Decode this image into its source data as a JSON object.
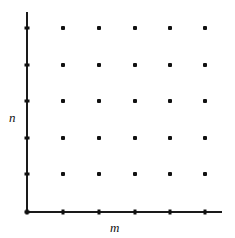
{
  "figure": {
    "name": "integer-lattice-grid",
    "background_color": "#ffffff",
    "width": 235,
    "height": 238
  },
  "axes": {
    "x_axis": {
      "label": "m",
      "color": "#1a1a1a",
      "line_width": 2,
      "y_pixel": 212,
      "start_x_pixel": 27,
      "end_x_pixel": 222
    },
    "y_axis": {
      "label": "n",
      "color": "#1a1a1a",
      "line_width": 2,
      "x_pixel": 27,
      "start_y_pixel": 12,
      "end_y_pixel": 212
    },
    "tick_color": "#111111",
    "tick_size": 5
  },
  "chart_data": {
    "type": "scatter",
    "title": "",
    "xlabel": "m",
    "ylabel": "n",
    "grid": false,
    "legend": null,
    "point_color": "#111111",
    "point_size_px": 4,
    "point_shape": "square",
    "xlim": [
      0,
      6
    ],
    "ylim": [
      0,
      6
    ],
    "x_ticks": [
      0,
      1,
      2,
      3,
      4,
      5
    ],
    "y_ticks": [
      0,
      1,
      2,
      3,
      4,
      5
    ],
    "x_tick_labels": [
      "",
      "",
      "",
      "",
      "",
      ""
    ],
    "y_tick_labels": [
      "",
      "",
      "",
      "",
      "",
      ""
    ],
    "x_tick_pixels": [
      27,
      63,
      99,
      135,
      170,
      205
    ],
    "y_tick_pixels": [
      212,
      174,
      138,
      101,
      65,
      28
    ],
    "points": [
      {
        "m": 1,
        "n": 1
      },
      {
        "m": 2,
        "n": 1
      },
      {
        "m": 3,
        "n": 1
      },
      {
        "m": 4,
        "n": 1
      },
      {
        "m": 5,
        "n": 1
      },
      {
        "m": 1,
        "n": 2
      },
      {
        "m": 2,
        "n": 2
      },
      {
        "m": 3,
        "n": 2
      },
      {
        "m": 4,
        "n": 2
      },
      {
        "m": 5,
        "n": 2
      },
      {
        "m": 1,
        "n": 3
      },
      {
        "m": 2,
        "n": 3
      },
      {
        "m": 3,
        "n": 3
      },
      {
        "m": 4,
        "n": 3
      },
      {
        "m": 5,
        "n": 3
      },
      {
        "m": 1,
        "n": 4
      },
      {
        "m": 2,
        "n": 4
      },
      {
        "m": 3,
        "n": 4
      },
      {
        "m": 4,
        "n": 4
      },
      {
        "m": 5,
        "n": 4
      },
      {
        "m": 1,
        "n": 5
      },
      {
        "m": 2,
        "n": 5
      },
      {
        "m": 3,
        "n": 5
      },
      {
        "m": 4,
        "n": 5
      },
      {
        "m": 5,
        "n": 5
      }
    ],
    "point_pixels": [
      {
        "x": 63,
        "y": 174
      },
      {
        "x": 99,
        "y": 174
      },
      {
        "x": 135,
        "y": 174
      },
      {
        "x": 170,
        "y": 174
      },
      {
        "x": 205,
        "y": 174
      },
      {
        "x": 63,
        "y": 138
      },
      {
        "x": 99,
        "y": 138
      },
      {
        "x": 135,
        "y": 138
      },
      {
        "x": 170,
        "y": 138
      },
      {
        "x": 205,
        "y": 138
      },
      {
        "x": 63,
        "y": 101
      },
      {
        "x": 99,
        "y": 101
      },
      {
        "x": 135,
        "y": 101
      },
      {
        "x": 170,
        "y": 101
      },
      {
        "x": 205,
        "y": 101
      },
      {
        "x": 63,
        "y": 65
      },
      {
        "x": 99,
        "y": 65
      },
      {
        "x": 135,
        "y": 65
      },
      {
        "x": 170,
        "y": 65
      },
      {
        "x": 205,
        "y": 65
      },
      {
        "x": 63,
        "y": 28
      },
      {
        "x": 99,
        "y": 28
      },
      {
        "x": 135,
        "y": 28
      },
      {
        "x": 170,
        "y": 28
      },
      {
        "x": 205,
        "y": 28
      }
    ]
  }
}
